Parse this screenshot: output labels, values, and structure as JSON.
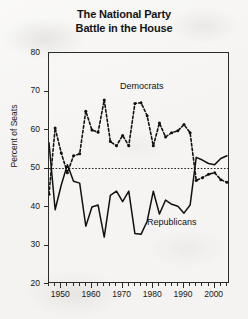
{
  "chart_data": {
    "type": "line",
    "title": "The National Party Battle in the House",
    "title_lines": [
      "The National Party",
      "Battle in the House"
    ],
    "xlabel": "",
    "ylabel": "Percent of Seats",
    "xlim": [
      1946,
      2005
    ],
    "ylim": [
      20,
      80
    ],
    "yticks": [
      20,
      30,
      40,
      50,
      60,
      70,
      80
    ],
    "xticks": [
      1950,
      1960,
      1970,
      1980,
      1990,
      2000
    ],
    "xtick_minor_step": 2,
    "grid": false,
    "legend_position": "inline-annotations",
    "reference_lines": [
      {
        "name": "majority-line",
        "axis": "y",
        "value": 50,
        "style": "dotted"
      }
    ],
    "annotations": [
      {
        "text": "Democrats",
        "x": 1971,
        "y": 67
      },
      {
        "text": "Republicans",
        "x": 1985,
        "y": 37
      }
    ],
    "series": [
      {
        "name": "Democrats",
        "style": "dotted",
        "color": "#111111",
        "x": [
          1946,
          1948,
          1950,
          1952,
          1954,
          1956,
          1958,
          1960,
          1962,
          1964,
          1966,
          1968,
          1970,
          1972,
          1974,
          1976,
          1978,
          1980,
          1982,
          1984,
          1986,
          1988,
          1990,
          1992,
          1994,
          1996,
          1998,
          2000,
          2002,
          2004
        ],
        "values": [
          43.3,
          60.5,
          54.0,
          48.9,
          53.3,
          53.8,
          64.9,
          60.0,
          59.4,
          67.8,
          57.0,
          55.9,
          58.6,
          55.9,
          66.9,
          67.1,
          63.7,
          55.9,
          61.8,
          58.2,
          59.3,
          59.8,
          61.4,
          59.3,
          46.9,
          47.6,
          48.5,
          48.9,
          47.1,
          46.4
        ]
      },
      {
        "name": "Republicans",
        "style": "solid",
        "color": "#111111",
        "x": [
          1946,
          1948,
          1950,
          1952,
          1954,
          1956,
          1958,
          1960,
          1962,
          1964,
          1966,
          1968,
          1970,
          1972,
          1974,
          1976,
          1978,
          1980,
          1982,
          1984,
          1986,
          1988,
          1990,
          1992,
          1994,
          1996,
          1998,
          2000,
          2002,
          2004
        ],
        "values": [
          56.7,
          39.3,
          45.7,
          51.0,
          46.7,
          46.2,
          35.0,
          40.0,
          40.5,
          32.2,
          43.0,
          44.1,
          41.4,
          44.1,
          33.1,
          32.9,
          36.3,
          44.1,
          38.2,
          41.8,
          40.7,
          40.2,
          38.4,
          40.5,
          52.9,
          52.2,
          51.3,
          51.0,
          52.6,
          53.3
        ]
      }
    ]
  }
}
